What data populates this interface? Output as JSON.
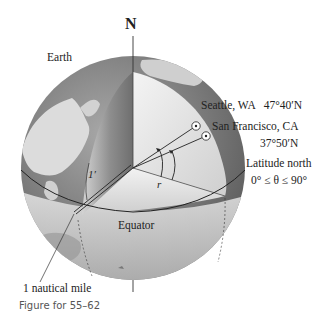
{
  "diagram": {
    "type": "Earth latitude diagram",
    "labels": {
      "north": "N",
      "earth": "Earth",
      "seattle": "Seattle, WA   47°40′N",
      "sf_line1": "San Francisco, CA",
      "sf_line2": "37°50′N",
      "latitude_line1": "Latitude north",
      "latitude_line2": "0° ≤ θ ≤ 90°",
      "radius": "r",
      "arc_minute": "1′",
      "equator": "Equator",
      "nautical_mile": "1 nautical mile"
    },
    "caption": "Figure for 55–62",
    "colors": {
      "ocean": "#7a7a7a",
      "land": "#d8d8d8",
      "cutaway_light": "#efefef",
      "cutaway_dark": "#8c8c8c",
      "line": "#222222",
      "caption": "#555555"
    }
  }
}
